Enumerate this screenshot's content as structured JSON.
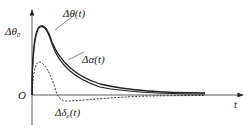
{
  "figure": {
    "type": "response-curves",
    "axes": {
      "x_label": "t",
      "origin_label": "O",
      "y_peak_label": "Δθ",
      "y_peak_subscript": "0"
    },
    "curves": [
      {
        "name": "delta-theta",
        "label": "Δθ(t)",
        "style": "solid",
        "color": "#222222"
      },
      {
        "name": "delta-alpha",
        "label": "Δα(t)",
        "style": "solid",
        "color": "#222222"
      },
      {
        "name": "delta-delta-e",
        "label_main": "Δδ",
        "label_sub": "e",
        "label_tail": "(t)",
        "style": "dashed",
        "color": "#222222"
      }
    ]
  }
}
